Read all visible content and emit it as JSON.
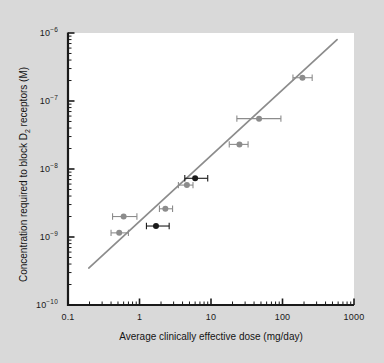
{
  "chart_data": {
    "type": "scatter",
    "title": "",
    "xlabel": "Average clinically effective dose (mg/day)",
    "ylabel": "Concentration required to block D2 receptors (M)",
    "ylabel_main": "Concentration required to block D",
    "ylabel_sub": "2",
    "ylabel_tail": " receptors (M)",
    "xscale": "log",
    "yscale": "log",
    "xlim": [
      0.1,
      1000
    ],
    "ylim": [
      1e-10,
      1e-06
    ],
    "grid": false,
    "legend": "none",
    "xticks": [
      0.1,
      1,
      10,
      100,
      1000
    ],
    "xtick_labels": [
      "0.1",
      "1",
      "10",
      "100",
      "1000"
    ],
    "yticks": [
      1e-10,
      1e-09,
      1e-08,
      1e-07,
      1e-06
    ],
    "ytick_labels": [
      "10-10",
      "10-9",
      "10-8",
      "10-7",
      "10-6"
    ],
    "ytick_mantissa": "10",
    "ytick_exponents": [
      "-10",
      "-9",
      "-8",
      "-7",
      "-6"
    ],
    "marker_colors": {
      "primary": "#8c8c8c",
      "highlight": "#1a1a1a"
    },
    "line_color": "#8c8c8c",
    "axis_color": "#1a1a1a",
    "background": "#d9d9d9",
    "plot_background": "#ffffff",
    "series": [
      {
        "name": "Antipsychotic drugs",
        "marker": "circle",
        "points": [
          {
            "x": 0.6,
            "y": 2e-09,
            "xerr_low": 0.42,
            "xerr_high": 0.92,
            "color": "#8c8c8c"
          },
          {
            "x": 0.52,
            "y": 1.15e-09,
            "xerr_low": 0.4,
            "xerr_high": 0.7,
            "color": "#8c8c8c"
          },
          {
            "x": 1.7,
            "y": 1.45e-09,
            "xerr_low": 1.25,
            "xerr_high": 2.6,
            "color": "#1a1a1a"
          },
          {
            "x": 2.3,
            "y": 2.6e-09,
            "xerr_low": 1.9,
            "xerr_high": 2.9,
            "color": "#8c8c8c"
          },
          {
            "x": 4.6,
            "y": 5.8e-09,
            "xerr_low": 3.5,
            "xerr_high": 5.6,
            "color": "#8c8c8c"
          },
          {
            "x": 6.0,
            "y": 7.3e-09,
            "xerr_low": 4.3,
            "xerr_high": 9.0,
            "color": "#1a1a1a"
          },
          {
            "x": 25.0,
            "y": 2.3e-08,
            "xerr_low": 18.0,
            "xerr_high": 33.0,
            "color": "#8c8c8c"
          },
          {
            "x": 47.0,
            "y": 5.5e-08,
            "xerr_low": 23.0,
            "xerr_high": 95.0,
            "color": "#8c8c8c"
          },
          {
            "x": 190.0,
            "y": 2.2e-07,
            "xerr_low": 140.0,
            "xerr_high": 260.0,
            "color": "#8c8c8c"
          }
        ]
      }
    ],
    "fit_line": {
      "name": "regression line",
      "x_start": 0.195,
      "y_start": 3.5e-10,
      "x_end": 580.0,
      "y_end": 8e-07
    }
  }
}
